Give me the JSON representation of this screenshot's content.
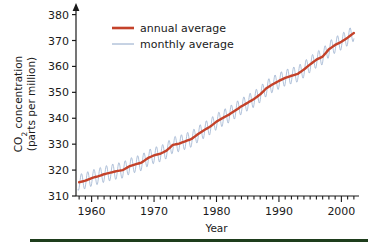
{
  "chart_data": {
    "type": "line",
    "title": "",
    "xlabel": "Year",
    "ylabel": "CO2 concentration (parts per million)",
    "ylabel_line1": "CO",
    "ylabel_sub": "2",
    "ylabel_line1b": " concentration",
    "ylabel_line2": "(parts per million)",
    "xlim": [
      1957.5,
      2002.5
    ],
    "ylim": [
      310,
      381
    ],
    "xticks": [
      1960,
      1970,
      1980,
      1990,
      2000
    ],
    "xtick_labels": [
      "1960",
      "1970",
      "1980",
      "1990",
      "2000"
    ],
    "xminor_tick_step": 1,
    "yticks": [
      310,
      320,
      330,
      340,
      350,
      360,
      370,
      380
    ],
    "ytick_labels": [
      "310",
      "320",
      "330",
      "340",
      "350",
      "360",
      "370",
      "380"
    ],
    "grid": false,
    "legend_position": "top-left",
    "y_axis_arrow": true,
    "series": [
      {
        "name": "annual average",
        "color": "#c4422a",
        "width": 2.4,
        "x": [
          1958,
          1959,
          1960,
          1961,
          1962,
          1963,
          1964,
          1965,
          1966,
          1967,
          1968,
          1969,
          1970,
          1971,
          1972,
          1973,
          1974,
          1975,
          1976,
          1977,
          1978,
          1979,
          1980,
          1981,
          1982,
          1983,
          1984,
          1985,
          1986,
          1987,
          1988,
          1989,
          1990,
          1991,
          1992,
          1993,
          1994,
          1995,
          1996,
          1997,
          1998,
          1999,
          2000,
          2001,
          2002
        ],
        "values": [
          315.3,
          315.9,
          316.9,
          317.6,
          318.4,
          319.0,
          319.6,
          320.0,
          321.4,
          322.2,
          322.9,
          324.6,
          325.7,
          326.3,
          327.5,
          329.7,
          330.2,
          331.1,
          332.0,
          333.8,
          335.4,
          336.8,
          338.7,
          340.1,
          341.4,
          343.0,
          344.6,
          346.0,
          347.4,
          349.2,
          351.6,
          353.1,
          354.4,
          355.6,
          356.4,
          357.1,
          358.8,
          360.8,
          362.6,
          363.8,
          366.6,
          368.3,
          369.5,
          371.1,
          372.9
        ]
      },
      {
        "name": "monthly average",
        "color": "#8ea6c8",
        "width": 0.7,
        "seasonal_amplitude_ppm": 3.1,
        "seasonal_peak_month": 5,
        "description": "monthly mean values oscillating about the annual average with an annual seasonal cycle"
      }
    ]
  },
  "legend": {
    "items": [
      {
        "label": "annual average",
        "color": "#c4422a",
        "style": "thick-line"
      },
      {
        "label": "monthly average",
        "color": "#8ea6c8",
        "style": "thin-line"
      }
    ]
  },
  "footer": {
    "bar_color": "#1e3d1c"
  }
}
